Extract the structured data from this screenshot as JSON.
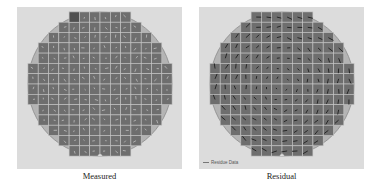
{
  "figure": {
    "panels": [
      {
        "id": "measured",
        "caption": "Measured",
        "legend": null,
        "vector_style": "light"
      },
      {
        "id": "residual",
        "caption": "Residual",
        "legend": "Residue Data",
        "vector_style": "dark"
      }
    ],
    "colors": {
      "panel_background": "#dcdcdc",
      "wafer_fill": "#b4b4b4",
      "die_fill": "#6e6e6e",
      "grid_line": "#c8c8c8",
      "wafer_edge": "#8a8a8a"
    },
    "wafer": {
      "grid_columns": 14,
      "grid_rows": 14,
      "row_spans": [
        [
          4,
          9
        ],
        [
          3,
          10
        ],
        [
          2,
          11
        ],
        [
          1,
          12
        ],
        [
          1,
          12
        ],
        [
          0,
          13
        ],
        [
          0,
          13
        ],
        [
          0,
          13
        ],
        [
          0,
          13
        ],
        [
          1,
          12
        ],
        [
          1,
          12
        ],
        [
          2,
          11
        ],
        [
          3,
          10
        ],
        [
          4,
          9
        ]
      ],
      "notch": "bottom"
    }
  }
}
